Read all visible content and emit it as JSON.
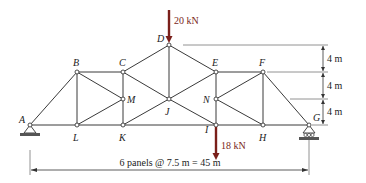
{
  "figure": {
    "nodes": [
      {
        "id": "A",
        "x": 30,
        "y": 125,
        "lx": 19,
        "ly": 123
      },
      {
        "id": "L",
        "x": 77,
        "y": 125,
        "lx": 73,
        "ly": 141
      },
      {
        "id": "K",
        "x": 123,
        "y": 125,
        "lx": 119,
        "ly": 141
      },
      {
        "id": "I",
        "x": 216,
        "y": 125,
        "lx": 205,
        "ly": 133
      },
      {
        "id": "H",
        "x": 263,
        "y": 125,
        "lx": 259,
        "ly": 141
      },
      {
        "id": "G",
        "x": 309,
        "y": 125,
        "lx": 313,
        "ly": 121
      },
      {
        "id": "B",
        "x": 77,
        "y": 72,
        "lx": 73,
        "ly": 66
      },
      {
        "id": "C",
        "x": 123,
        "y": 72,
        "lx": 119,
        "ly": 66
      },
      {
        "id": "E",
        "x": 216,
        "y": 72,
        "lx": 212,
        "ly": 66
      },
      {
        "id": "F",
        "x": 263,
        "y": 72,
        "lx": 259,
        "ly": 66
      },
      {
        "id": "D",
        "x": 169,
        "y": 45,
        "lx": 157,
        "ly": 42
      },
      {
        "id": "M",
        "x": 123,
        "y": 99,
        "lx": 127,
        "ly": 103
      },
      {
        "id": "J",
        "x": 169,
        "y": 99,
        "lx": 165,
        "ly": 115
      },
      {
        "id": "N",
        "x": 216,
        "y": 99,
        "lx": 203,
        "ly": 103
      }
    ],
    "members": [
      [
        "A",
        "L"
      ],
      [
        "L",
        "K"
      ],
      [
        "K",
        "I"
      ],
      [
        "I",
        "H"
      ],
      [
        "H",
        "G"
      ],
      [
        "A",
        "B"
      ],
      [
        "B",
        "C"
      ],
      [
        "C",
        "D"
      ],
      [
        "D",
        "E"
      ],
      [
        "E",
        "F"
      ],
      [
        "F",
        "G"
      ],
      [
        "B",
        "L"
      ],
      [
        "B",
        "M"
      ],
      [
        "L",
        "M"
      ],
      [
        "C",
        "M"
      ],
      [
        "M",
        "K"
      ],
      [
        "C",
        "J"
      ],
      [
        "K",
        "J"
      ],
      [
        "D",
        "J"
      ],
      [
        "J",
        "E"
      ],
      [
        "J",
        "I"
      ],
      [
        "E",
        "N"
      ],
      [
        "N",
        "I"
      ],
      [
        "F",
        "N"
      ],
      [
        "N",
        "H"
      ],
      [
        "F",
        "H"
      ]
    ],
    "loads": [
      {
        "node": "D",
        "label": "20 kN",
        "direction": "down",
        "x": 169,
        "y1": 10,
        "y2": 43,
        "tx": 174,
        "ty": 24
      },
      {
        "node": "I",
        "label": "18 kN",
        "direction": "down",
        "x": 216,
        "y1": 127,
        "y2": 160,
        "tx": 221,
        "ty": 149
      }
    ],
    "supports": [
      {
        "node": "A",
        "type": "pin"
      },
      {
        "node": "G",
        "type": "roller"
      }
    ],
    "vertical_dimensions": [
      {
        "label": "4 m",
        "y_top": 45,
        "y_bot": 72
      },
      {
        "label": "4 m",
        "y_top": 72,
        "y_bot": 99
      },
      {
        "label": "4 m",
        "y_top": 99,
        "y_bot": 125
      }
    ],
    "horizontal_dimension": {
      "label": "6 panels @ 7.5 m = 45 m",
      "x_left": 30,
      "x_right": 309,
      "y": 170
    },
    "colors": {
      "member": "#3a3a3a",
      "load": "#7a1f1a",
      "dimension": "#333333"
    }
  }
}
